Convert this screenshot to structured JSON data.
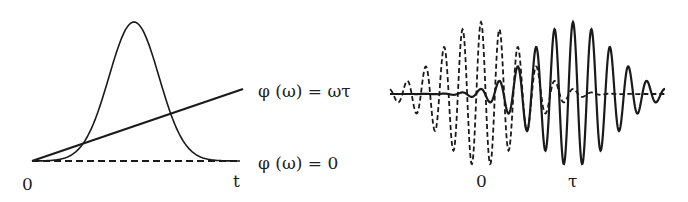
{
  "left_panel": {
    "phase_linear_label": "φ (ω) = ωτ",
    "phase_zero_label": "φ (ω) = 0",
    "origin_label": "0",
    "axis_label": "t",
    "gaussian": {
      "x0": 32,
      "x1": 240,
      "baseline_y": 161,
      "center_x": 134,
      "peak_y": 22,
      "sigma": 25
    },
    "phase_line": {
      "x1": 32,
      "y1": 161,
      "x2": 243,
      "y2": 89
    },
    "zero_line": {
      "x1": 32,
      "x2": 240,
      "y": 161
    }
  },
  "right_panel": {
    "origin_label": "0",
    "delay_label": "τ",
    "baseline_y": 94,
    "x0": 390,
    "x1": 665,
    "dashed_packet": {
      "center_x": 481,
      "amplitude": 72,
      "sigma": 40,
      "period": 18.5
    },
    "solid_packet": {
      "center_x": 573,
      "amplitude": 72,
      "sigma": 40,
      "period": 18.5
    }
  },
  "colors": {
    "ink": "#1a1a1a",
    "background": "#ffffff"
  }
}
